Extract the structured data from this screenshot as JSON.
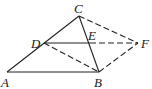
{
  "diagram": {
    "type": "geometry",
    "points": {
      "A": {
        "label": "A",
        "x": 7,
        "y": 72
      },
      "B": {
        "label": "B",
        "x": 99,
        "y": 72
      },
      "C": {
        "label": "C",
        "x": 79,
        "y": 16
      },
      "D": {
        "label": "D",
        "x": 44,
        "y": 43
      },
      "E": {
        "label": "E",
        "x": 90,
        "y": 43
      },
      "F": {
        "label": "F",
        "x": 138,
        "y": 43
      }
    },
    "segments": [
      {
        "from": "A",
        "to": "C",
        "style": "solid"
      },
      {
        "from": "A",
        "to": "B",
        "style": "solid"
      },
      {
        "from": "C",
        "to": "B",
        "style": "solid"
      },
      {
        "from": "D",
        "to": "E",
        "style": "solid"
      },
      {
        "from": "E",
        "to": "F",
        "style": "dashed"
      },
      {
        "from": "C",
        "to": "F",
        "style": "dashed"
      },
      {
        "from": "B",
        "to": "F",
        "style": "dashed"
      },
      {
        "from": "D",
        "to": "B",
        "style": "dashed"
      }
    ],
    "colors": {
      "stroke": "#222222",
      "background": "#ffffff"
    }
  }
}
